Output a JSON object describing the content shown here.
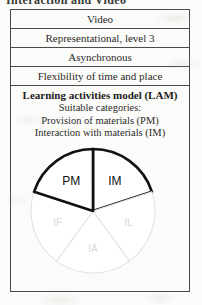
{
  "caption": {
    "clipped_text": "Interaction and Video"
  },
  "figure": {
    "table_rows": [
      {
        "label": "Video"
      },
      {
        "label": "Representational, level 3"
      },
      {
        "label": "Asynchronous"
      },
      {
        "label": "Flexibility of time and place"
      }
    ],
    "lam": {
      "title": "Learning activities model (LAM)",
      "lines": [
        "Suitable categories:",
        "Provision of materials (PM)",
        "Interaction with materials (IM)"
      ]
    }
  },
  "chart_data": {
    "type": "pie",
    "title": "Learning activities model (LAM)",
    "categories": [
      "IM",
      "IL",
      "IA",
      "IF",
      "PM"
    ],
    "values": [
      20,
      20,
      20,
      20,
      20
    ],
    "labels": [
      "IM",
      "IL",
      "IA",
      "IF",
      "PM"
    ],
    "highlighted": [
      "PM",
      "IM"
    ],
    "faded": [
      "IF",
      "IA",
      "IL"
    ],
    "slice_count": 5,
    "slice_angle_deg": 72,
    "legend": "none",
    "colors": {
      "highlight_stroke": "#111111",
      "faded_stroke": "#e2e2e0",
      "highlight_text": "#111111",
      "faded_text": "#d8d8d6",
      "fill": "#ffffff"
    }
  }
}
